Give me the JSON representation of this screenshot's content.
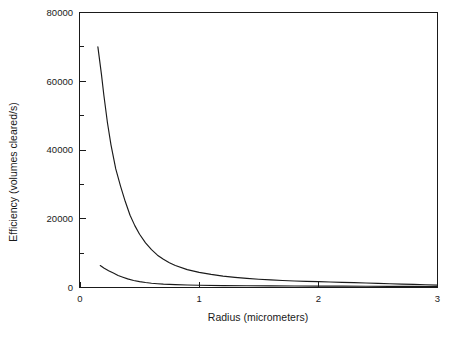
{
  "chart_data": {
    "type": "line",
    "title": "",
    "xlabel": "Radius (micrometers)",
    "ylabel": "Efficiency  (volumes cleared/s)",
    "xlim": [
      0,
      3
    ],
    "ylim": [
      0,
      80000
    ],
    "grid": false,
    "legend": "none",
    "xticks": [
      0,
      1,
      2,
      3
    ],
    "xtick_labels": [
      "0",
      "1",
      "2",
      "3"
    ],
    "yticks": [
      0,
      20000,
      40000,
      60000,
      80000
    ],
    "ytick_labels": [
      "0",
      "20000",
      "40000",
      "60000",
      "80000"
    ],
    "yminor_ticks": [
      10000,
      30000,
      50000,
      70000
    ],
    "series": [
      {
        "name": "upper-curve",
        "x": [
          0.15,
          0.18,
          0.2,
          0.23,
          0.26,
          0.3,
          0.34,
          0.38,
          0.42,
          0.46,
          0.5,
          0.55,
          0.6,
          0.65,
          0.7,
          0.75,
          0.8,
          0.9,
          1.0,
          1.1,
          1.2,
          1.3,
          1.4,
          1.5,
          1.6,
          1.7,
          1.8,
          1.9,
          2.0,
          2.1,
          2.2,
          2.3,
          2.4,
          2.5,
          2.6,
          2.7,
          2.8,
          2.9,
          3.0
        ],
        "y": [
          70000,
          62000,
          56000,
          48000,
          41500,
          34500,
          29500,
          25000,
          21000,
          18000,
          15500,
          13000,
          11000,
          9400,
          8200,
          7200,
          6400,
          5200,
          4400,
          3800,
          3300,
          2950,
          2650,
          2400,
          2200,
          2050,
          1900,
          1800,
          1700,
          1600,
          1500,
          1400,
          1300,
          1200,
          1100,
          1000,
          900,
          800,
          700
        ]
      },
      {
        "name": "lower-curve",
        "x": [
          0.17,
          0.2,
          0.24,
          0.28,
          0.32,
          0.36,
          0.4,
          0.45,
          0.5,
          0.55,
          0.6,
          0.65,
          0.7,
          0.8,
          0.9,
          1.0,
          1.2,
          1.4,
          1.6,
          1.8,
          2.0,
          2.2,
          2.4,
          2.6,
          2.8,
          3.0
        ],
        "y": [
          6400,
          5700,
          4900,
          4200,
          3500,
          3000,
          2500,
          2050,
          1700,
          1450,
          1250,
          1100,
          980,
          820,
          720,
          650,
          560,
          500,
          460,
          430,
          400,
          380,
          360,
          340,
          320,
          300
        ]
      }
    ]
  },
  "axes": {
    "x_title": "Radius (micrometers)",
    "y_title": "Efficiency  (volumes cleared/s)"
  }
}
